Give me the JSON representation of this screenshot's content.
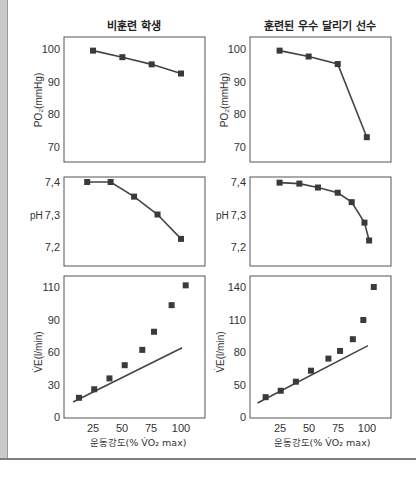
{
  "colors": {
    "line": "#444444",
    "marker": "#3a3a3a",
    "frame": "#555555",
    "band": "#c9c9c9"
  },
  "chart_data": [
    {
      "id": "po2-untrained",
      "type": "line",
      "title": "비훈련 학생",
      "ylabel": "PO₂(mmHg)",
      "xlabel": "",
      "ylim": [
        66,
        104
      ],
      "yticks": [
        100,
        90,
        80,
        70
      ],
      "x": [
        25,
        50,
        75,
        100
      ],
      "values": [
        99.5,
        97.5,
        95.3,
        92.5
      ]
    },
    {
      "id": "po2-trained",
      "type": "line",
      "title": "훈련된 우수 달리기 선수",
      "ylabel": "PO₂(mmHg)",
      "xlabel": "",
      "ylim": [
        66,
        104
      ],
      "yticks": [
        100,
        90,
        80,
        70
      ],
      "x": [
        25,
        50,
        75,
        100
      ],
      "values": [
        99.5,
        97.7,
        95.4,
        73.0
      ]
    },
    {
      "id": "ph-untrained",
      "type": "line",
      "title": "",
      "ylabel": "pH",
      "xlabel": "",
      "ylim": [
        7.16,
        7.42
      ],
      "yticks": [
        "7,4",
        "7,3",
        "7,2"
      ],
      "x": [
        20,
        40,
        60,
        80,
        100
      ],
      "values": [
        7.4,
        7.4,
        7.355,
        7.3,
        7.225
      ]
    },
    {
      "id": "ph-trained",
      "type": "line",
      "title": "",
      "ylabel": "pH",
      "xlabel": "",
      "ylim": [
        7.16,
        7.42
      ],
      "yticks": [
        "7,4",
        "7,3",
        "7,2"
      ],
      "x": [
        25,
        42,
        58,
        75,
        87,
        98,
        102
      ],
      "values": [
        7.398,
        7.395,
        7.383,
        7.367,
        7.338,
        7.275,
        7.22
      ]
    },
    {
      "id": "ve-untrained",
      "type": "scatter",
      "title": "",
      "ylabel": "V̇E(l/min)",
      "xlabel": "운동강도(% V̇O₂ max)",
      "xlim": [
        0,
        120
      ],
      "xticks": [
        25,
        50,
        75,
        100
      ],
      "yticks": [
        110,
        90,
        60,
        30,
        0
      ],
      "x": [
        13,
        26,
        39,
        52,
        67,
        77,
        92,
        104
      ],
      "values": [
        18,
        26,
        36,
        48,
        62,
        79,
        99,
        111
      ],
      "trend": {
        "x": [
          8,
          101
        ],
        "values": [
          14,
          64
        ]
      }
    },
    {
      "id": "ve-trained",
      "type": "scatter",
      "title": "",
      "ylabel": "V̇E(l/min)",
      "xlabel": "운동강도(% V̇O₂ max)",
      "xlim": [
        0,
        120
      ],
      "xticks": [
        25,
        50,
        75,
        100
      ],
      "yticks": [
        140,
        110,
        80,
        50,
        0
      ],
      "x": [
        13,
        26,
        39,
        52,
        67,
        77,
        88,
        97,
        106
      ],
      "values": [
        31,
        41,
        53,
        63,
        74,
        81,
        92,
        110,
        140
      ],
      "trend": {
        "x": [
          6,
          101
        ],
        "values": [
          22,
          86
        ]
      }
    }
  ],
  "labels": {
    "title_left": "비훈련 학생",
    "title_right": "훈련된 우수 달리기 선수",
    "po2_ylabel": "PO₂(mmHg)",
    "ph_ylabel": "pH",
    "ve_ylabel": "V̇E(l/min)",
    "xlabel": "운동강도(% V̇O₂ max)",
    "po2_ticks": [
      "100",
      "90",
      "80",
      "70"
    ],
    "ph_ticks": [
      "7,4",
      "7,3",
      "7,2"
    ],
    "ve_ticks_left": [
      "110",
      "90",
      "60",
      "30",
      "0"
    ],
    "ve_ticks_right": [
      "140",
      "110",
      "80",
      "50",
      "0"
    ],
    "x_ticks": [
      "25",
      "50",
      "75",
      "100"
    ]
  }
}
